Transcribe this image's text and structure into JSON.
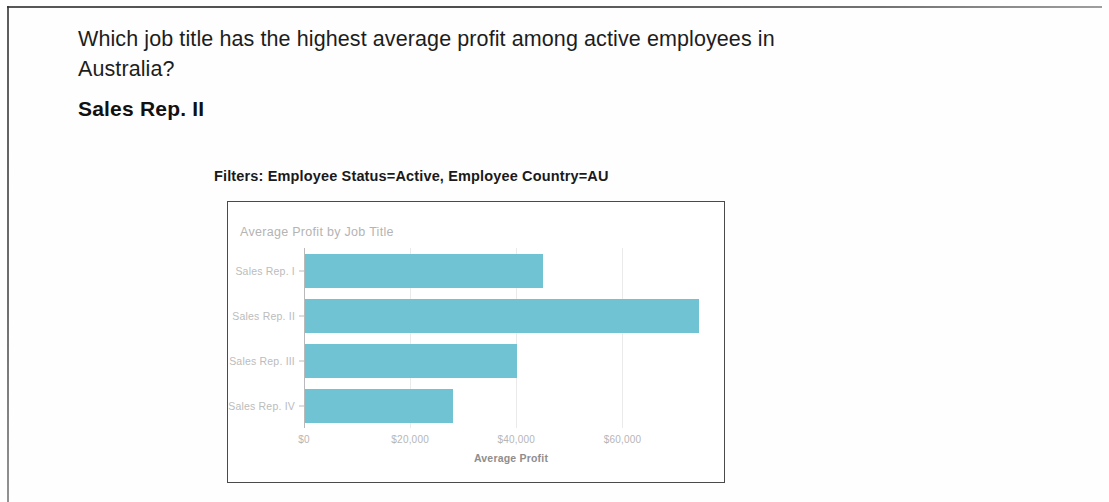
{
  "page": {
    "question": "Which job title has the highest average profit among active employees in Australia?",
    "answer": "Sales Rep. II",
    "filters_caption": "Filters: Employee Status=Active,  Employee Country=AU"
  },
  "colors": {
    "bar": "#6fc3d2",
    "chart_border": "#4a4a4a",
    "axis": "#b9b9b9",
    "tick_text": "#b6b6b6"
  },
  "chart_data": {
    "type": "bar",
    "orientation": "horizontal",
    "title": "Average Profit by Job Title",
    "xlabel": "Average Profit",
    "ylabel": "",
    "categories": [
      "Sales Rep. I",
      "Sales Rep. II",
      "Sales Rep. III",
      "Sales Rep. IV"
    ],
    "values": [
      44900,
      74300,
      40000,
      27900
    ],
    "tick_labels": [
      "$0",
      "$20,000",
      "$40,000",
      "$60,000"
    ],
    "tick_values": [
      0,
      20000,
      40000,
      60000
    ],
    "xlim": [
      0,
      78000
    ],
    "grid": true,
    "legend": "none",
    "series": [
      {
        "name": "Average Profit",
        "values": [
          44900,
          74300,
          40000,
          27900
        ]
      }
    ]
  }
}
